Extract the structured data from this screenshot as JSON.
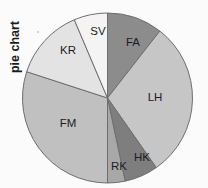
{
  "figure": {
    "axis_label": "pie chart",
    "background_color": "#fbfbfb",
    "stroke_color": "#6e6e6e",
    "label_text_color": "#1c1c1c"
  },
  "chart_data": {
    "type": "pie",
    "title": "",
    "ylabel": "pie chart",
    "xlabel": "",
    "legend": "none",
    "grid": false,
    "start_angle_deg": 0,
    "direction": "clockwise",
    "center": {
      "x": 107.5,
      "y": 98
    },
    "radius": 85,
    "categories": [
      "FA",
      "LH",
      "HK",
      "RK",
      "FM",
      "KR",
      "SV"
    ],
    "values": [
      10.6,
      29.7,
      6.4,
      3.3,
      30.0,
      13.6,
      6.4
    ],
    "angles_deg": [
      38,
      107,
      23,
      12,
      108,
      49,
      23
    ],
    "boundaries_deg": [
      0,
      38,
      145,
      168,
      180,
      288,
      337,
      360
    ],
    "colors": [
      "#8c8c8c",
      "#c6c6c6",
      "#7e7e7e",
      "#a8a8a8",
      "#c0c0c0",
      "#e3e3e3",
      "#f4f4f4"
    ],
    "slices": [
      {
        "label": "FA",
        "value": 10.6,
        "angle_deg": 38,
        "start_deg": 0,
        "end_deg": 38,
        "color": "#8c8c8c",
        "label_x": 133,
        "label_y": 43
      },
      {
        "label": "LH",
        "value": 29.7,
        "angle_deg": 107,
        "start_deg": 38,
        "end_deg": 145,
        "color": "#c6c6c6",
        "label_x": 155,
        "label_y": 98
      },
      {
        "label": "HK",
        "value": 6.4,
        "angle_deg": 23,
        "start_deg": 145,
        "end_deg": 168,
        "color": "#7e7e7e",
        "label_x": 142,
        "label_y": 158
      },
      {
        "label": "RK",
        "value": 3.3,
        "angle_deg": 12,
        "start_deg": 168,
        "end_deg": 180,
        "color": "#a8a8a8",
        "label_x": 119,
        "label_y": 167
      },
      {
        "label": "FM",
        "value": 30.0,
        "angle_deg": 108,
        "start_deg": 180,
        "end_deg": 288,
        "color": "#c0c0c0",
        "label_x": 68,
        "label_y": 124
      },
      {
        "label": "KR",
        "value": 13.6,
        "angle_deg": 49,
        "start_deg": 288,
        "end_deg": 337,
        "color": "#e3e3e3",
        "label_x": 68,
        "label_y": 51
      },
      {
        "label": "SV",
        "value": 6.4,
        "angle_deg": 23,
        "start_deg": 337,
        "end_deg": 360,
        "color": "#f4f4f4",
        "label_x": 98,
        "label_y": 32
      }
    ]
  }
}
